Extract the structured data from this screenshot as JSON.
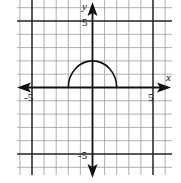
{
  "chart_data": {
    "type": "line",
    "title": "",
    "xlabel": "x",
    "ylabel": "y",
    "xlim": [
      -6,
      6.5
    ],
    "ylim": [
      -6.5,
      6.5
    ],
    "grid": true,
    "grid_step": 1,
    "x_tick_labels": [
      {
        "value": -5,
        "label": "-5"
      },
      {
        "value": 5,
        "label": "5"
      }
    ],
    "y_tick_labels": [
      {
        "value": 5,
        "label": "5"
      },
      {
        "value": -5,
        "label": "-5"
      }
    ],
    "series": [
      {
        "name": "upper semicircle y = sqrt(4 - x^2)",
        "x": [
          -2,
          -1.5,
          -1,
          -0.5,
          0,
          0.5,
          1,
          1.5,
          2
        ],
        "y": [
          0,
          1.32,
          1.73,
          1.94,
          2,
          1.94,
          1.73,
          1.32,
          0
        ]
      }
    ]
  },
  "labels": {
    "x_axis": "x",
    "y_axis": "y",
    "x_neg5": "-5",
    "x_pos5": "5",
    "y_pos5": "5",
    "y_neg5": "-5"
  },
  "colors": {
    "grid": "#9a9a9a",
    "grid_major": "#222222",
    "axis": "#111111",
    "curve": "#111111"
  }
}
